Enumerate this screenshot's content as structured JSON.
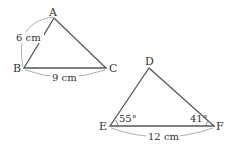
{
  "diagram": {
    "triangle1": {
      "vertices": {
        "A": "A",
        "B": "B",
        "C": "C"
      },
      "side_AB": "6 cm",
      "side_BC": "9 cm"
    },
    "triangle2": {
      "vertices": {
        "D": "D",
        "E": "E",
        "F": "F"
      },
      "angle_E": "55°",
      "angle_F": "41°",
      "side_EF": "12 cm"
    },
    "colors": {
      "stroke": "#555555",
      "arc": "#888888",
      "text": "#333333"
    }
  }
}
